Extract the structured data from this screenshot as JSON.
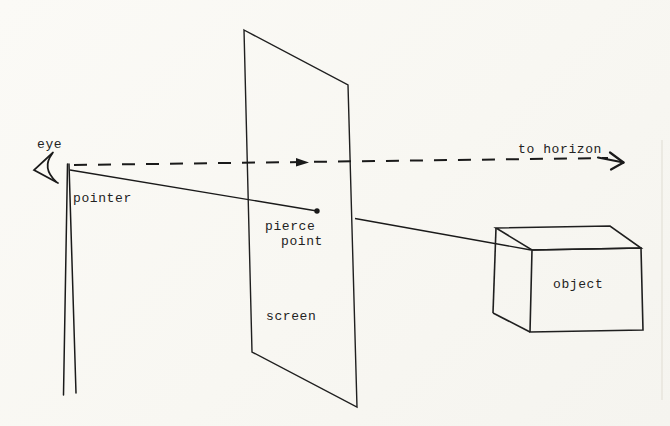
{
  "figure": {
    "paper_color": "#faf9f5",
    "ink_color": "#1f1f1f",
    "labels": {
      "eye": "eye",
      "pointer": "pointer",
      "pierce_line1": "pierce",
      "pierce_line2": "point",
      "screen": "screen",
      "to_horizon": "to horizon",
      "object": "object"
    }
  }
}
